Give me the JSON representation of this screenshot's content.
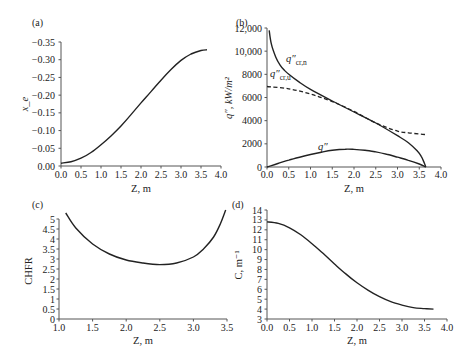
{
  "chart_data": [
    {
      "id": "a",
      "panel_label": "(a)",
      "type": "line",
      "xlabel": "Z, m",
      "ylabel": "x_e",
      "xlim": [
        0.0,
        4.0
      ],
      "ylim": [
        -0.35,
        0.0
      ],
      "xticks": [
        "0.0",
        "0.5",
        "1.0",
        "1.5",
        "2.0",
        "2.5",
        "3.0",
        "3.5",
        "4.0"
      ],
      "yticks": [
        "0.00",
        "−0.05",
        "−0.10",
        "−0.15",
        "−0.20",
        "−0.25",
        "−0.30",
        "−0.35"
      ],
      "grid": false,
      "series": [
        {
          "name": "x_e",
          "style": "solid",
          "x": [
            0.0,
            0.25,
            0.5,
            0.75,
            1.0,
            1.25,
            1.5,
            1.75,
            2.0,
            2.25,
            2.5,
            2.75,
            3.0,
            3.25,
            3.5,
            3.65
          ],
          "y": [
            -0.342,
            -0.338,
            -0.328,
            -0.312,
            -0.29,
            -0.265,
            -0.237,
            -0.205,
            -0.172,
            -0.14,
            -0.108,
            -0.078,
            -0.052,
            -0.034,
            -0.024,
            -0.022
          ]
        }
      ]
    },
    {
      "id": "b",
      "panel_label": "(b)",
      "type": "line",
      "xlabel": "Z, m",
      "ylabel": "q″, kW/m²",
      "xlim": [
        0.0,
        4.0
      ],
      "ylim": [
        0,
        12000
      ],
      "xticks": [
        "0.0",
        "0.5",
        "1.0",
        "1.5",
        "2.0",
        "2.5",
        "3.0",
        "3.5",
        "4.0"
      ],
      "yticks": [
        "0",
        "2000",
        "4000",
        "6000",
        "8000",
        "10,000",
        "12,000"
      ],
      "grid": false,
      "annotations": [
        "q″cr,n",
        "q″cr,u",
        "q″"
      ],
      "series": [
        {
          "name": "q″cr,n",
          "style": "solid",
          "x": [
            0.05,
            0.1,
            0.2,
            0.3,
            0.4,
            0.5,
            0.75,
            1.0,
            1.5,
            2.0,
            2.5,
            3.0,
            3.25,
            3.45,
            3.55,
            3.62,
            3.65
          ],
          "y": [
            11800,
            10600,
            9500,
            8800,
            8350,
            8000,
            7300,
            6700,
            5700,
            4750,
            3800,
            2700,
            2100,
            1400,
            900,
            300,
            0
          ]
        },
        {
          "name": "q″cr,u",
          "style": "dashed",
          "x": [
            0.0,
            0.5,
            1.0,
            1.5,
            2.0,
            2.5,
            3.0,
            3.25,
            3.5,
            3.65
          ],
          "y": [
            6950,
            6750,
            6300,
            5650,
            4800,
            3800,
            3100,
            2950,
            2850,
            2800
          ]
        },
        {
          "name": "q″",
          "style": "solid",
          "x": [
            0.0,
            0.25,
            0.5,
            0.75,
            1.0,
            1.25,
            1.5,
            1.8,
            2.0,
            2.25,
            2.5,
            2.75,
            3.0,
            3.25,
            3.5,
            3.65
          ],
          "y": [
            0,
            300,
            600,
            850,
            1080,
            1280,
            1440,
            1540,
            1520,
            1440,
            1300,
            1100,
            850,
            580,
            260,
            0
          ]
        }
      ]
    },
    {
      "id": "c",
      "panel_label": "(c)",
      "type": "line",
      "xlabel": "Z, m",
      "ylabel": "CHFR",
      "xlim": [
        1.0,
        3.5
      ],
      "ylim": [
        0,
        5
      ],
      "xticks": [
        "1.0",
        "1.5",
        "2.0",
        "2.5",
        "3.0",
        "3.5"
      ],
      "yticks": [
        "0",
        "0.5",
        "1",
        "1.5",
        "2",
        "2.5",
        "3",
        "3.5",
        "4",
        "4.5",
        "5"
      ],
      "grid": false,
      "series": [
        {
          "name": "CHFR",
          "style": "solid",
          "x": [
            1.1,
            1.25,
            1.5,
            1.75,
            2.0,
            2.25,
            2.5,
            2.75,
            3.0,
            3.15,
            3.3,
            3.4,
            3.48
          ],
          "y": [
            5.3,
            4.55,
            3.75,
            3.25,
            2.95,
            2.8,
            2.72,
            2.8,
            3.1,
            3.5,
            4.1,
            4.75,
            5.45
          ]
        }
      ]
    },
    {
      "id": "d",
      "panel_label": "(d)",
      "type": "line",
      "xlabel": "Z, m",
      "ylabel": "C, m⁻¹",
      "xlim": [
        0.0,
        4.0
      ],
      "ylim": [
        3,
        14
      ],
      "xticks": [
        "0.0",
        "0.5",
        "1.0",
        "1.5",
        "2.0",
        "2.5",
        "3.0",
        "3.5",
        "4.0"
      ],
      "yticks": [
        "3",
        "4",
        "5",
        "6",
        "7",
        "8",
        "9",
        "10",
        "11",
        "12",
        "13",
        "14"
      ],
      "grid": false,
      "series": [
        {
          "name": "C",
          "style": "solid",
          "x": [
            0.0,
            0.25,
            0.5,
            0.75,
            1.0,
            1.25,
            1.5,
            1.75,
            2.0,
            2.25,
            2.5,
            2.75,
            3.0,
            3.25,
            3.5,
            3.7
          ],
          "y": [
            12.8,
            12.65,
            12.2,
            11.5,
            10.6,
            9.6,
            8.55,
            7.55,
            6.65,
            5.9,
            5.25,
            4.75,
            4.4,
            4.15,
            4.05,
            4.0
          ]
        }
      ]
    }
  ]
}
